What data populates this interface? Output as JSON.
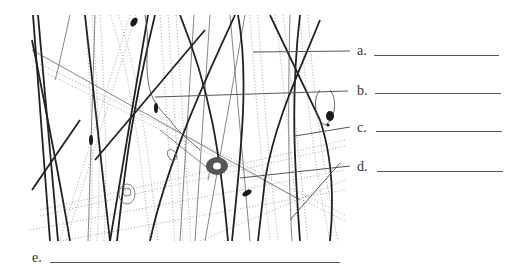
{
  "diagram": {
    "colors": {
      "ink": "#222222",
      "fiber_light": "#9a9a9a",
      "label_text": "#333333",
      "blank_line": "#555555"
    },
    "labels": [
      {
        "id": "a",
        "text": "a.",
        "answer": ""
      },
      {
        "id": "b",
        "text": "b.",
        "answer": ""
      },
      {
        "id": "c",
        "text": "c.",
        "answer": ""
      },
      {
        "id": "d",
        "text": "d.",
        "answer": ""
      },
      {
        "id": "e",
        "text": "e.",
        "answer": ""
      }
    ]
  }
}
